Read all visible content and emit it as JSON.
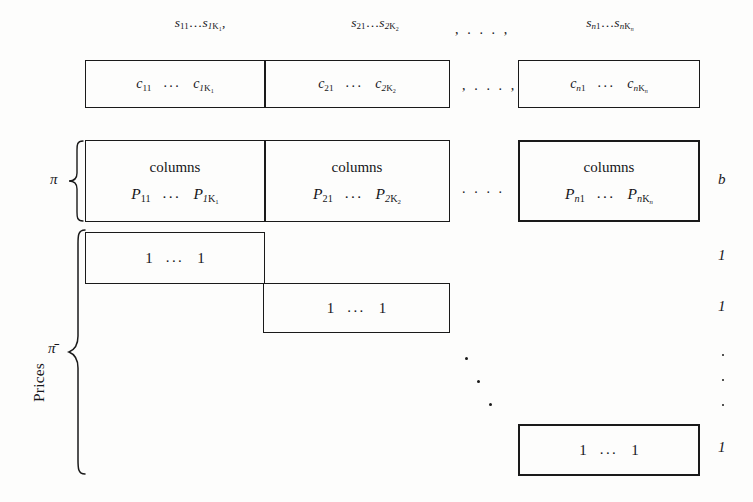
{
  "figure": {
    "caption_vertical": "Prices",
    "headers": [
      {
        "text": "S11…S1K1",
        "parts": {
          "s1": "s",
          "sub1": "11",
          "dots": "…",
          "s2": "s",
          "sub2": "1K1",
          "trailing": ","
        }
      },
      {
        "text": "S21…S2K2"
      },
      {
        "text": "Sn1…SnKn"
      }
    ],
    "header_ellipsis": ", . . . ,",
    "cost_row": {
      "blocks": [
        {
          "left": "c11",
          "dots": "...",
          "right": "c1K1"
        },
        {
          "left": "c21",
          "dots": "...",
          "right": "c2K2"
        },
        {
          "left": "cn1",
          "dots": "...",
          "right": "cnKn"
        }
      ],
      "between_blocks": ", . . . ,"
    },
    "p_row": {
      "word": "columns",
      "blocks": [
        {
          "left": "P11",
          "dots": "...",
          "right": "P1K1"
        },
        {
          "left": "P21",
          "dots": "...",
          "right": "P2K2"
        },
        {
          "left": "Pn1",
          "dots": "...",
          "right": "PnKn"
        }
      ],
      "between_blocks": ". . . .",
      "right_label": "b"
    },
    "ones_rows": [
      {
        "left": "1",
        "dots": "...",
        "right": "1",
        "rhs": "1"
      },
      {
        "left": "1",
        "dots": "...",
        "right": "1",
        "rhs": "1"
      },
      {
        "left": "1",
        "dots": "...",
        "right": "1",
        "rhs": "1"
      }
    ],
    "braces": [
      {
        "label": "π",
        "name": "pi"
      },
      {
        "label": "π̄",
        "name": "pi-bar"
      }
    ],
    "rhs_column": [
      "b",
      "1",
      "1",
      "1"
    ],
    "vertical_dots_count": 3,
    "diagonal_dots_count": 3
  },
  "colors": {
    "ink": "#16161a",
    "rule": "#1a1a1a",
    "paper": "#fdfdfc"
  }
}
